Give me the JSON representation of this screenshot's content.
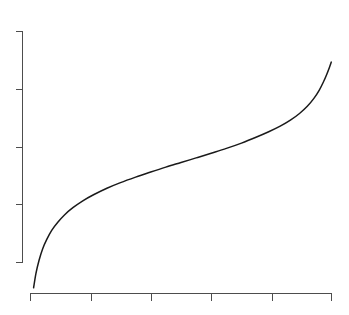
{
  "figure": {
    "title": "",
    "background_color": "#ffffff",
    "width": 349,
    "height": 315
  },
  "axes": {
    "line_color": "#4d4d4d",
    "x_axis": {
      "label": "",
      "tick_labels": [
        "",
        "",
        "",
        "",
        "",
        ""
      ],
      "tick_count": 6,
      "pixel_start": 30,
      "pixel_end": 332,
      "pixel_y": 293
    },
    "y_axis": {
      "label": "",
      "tick_labels": [
        "",
        "",
        "",
        "",
        ""
      ],
      "tick_count": 5,
      "pixel_top": 31,
      "pixel_bottom": 262,
      "pixel_x": 22
    }
  },
  "curve": {
    "color": "#1a1a1a",
    "stroke_width": 1.5,
    "shape": "sigmoid-quantile",
    "legend_label": ""
  },
  "chart_data": {
    "type": "line",
    "title": "",
    "subtitle": "",
    "xlabel": "",
    "ylabel": "",
    "grid": false,
    "legend": null,
    "legend_position": "none",
    "xlim": [
      0,
      1
    ],
    "ylim": [
      0,
      1
    ],
    "x_tick_labels": [
      "",
      "",
      "",
      "",
      "",
      ""
    ],
    "y_tick_labels": [
      "",
      "",
      "",
      "",
      ""
    ],
    "series": [
      {
        "name": "quantile-curve",
        "color": "#1a1a1a",
        "x": [
          0.012,
          0.02,
          0.03,
          0.042,
          0.056,
          0.072,
          0.092,
          0.115,
          0.142,
          0.175,
          0.212,
          0.255,
          0.3,
          0.35,
          0.4,
          0.45,
          0.5,
          0.55,
          0.6,
          0.65,
          0.7,
          0.748,
          0.79,
          0.828,
          0.862,
          0.892,
          0.918,
          0.94,
          0.958,
          0.972,
          0.983,
          0.992,
          0.998
        ],
        "y": [
          0.022,
          0.085,
          0.14,
          0.19,
          0.232,
          0.27,
          0.305,
          0.338,
          0.368,
          0.398,
          0.425,
          0.452,
          0.476,
          0.5,
          0.522,
          0.543,
          0.563,
          0.583,
          0.603,
          0.624,
          0.647,
          0.672,
          0.696,
          0.72,
          0.746,
          0.775,
          0.806,
          0.84,
          0.876,
          0.912,
          0.945,
          0.975,
          0.997
        ]
      }
    ],
    "pixel_points": [
      [
        33.6,
        287.8
      ],
      [
        36.0,
        273.2
      ],
      [
        39.0,
        260.5
      ],
      [
        42.6,
        248.9
      ],
      [
        46.9,
        239.2
      ],
      [
        51.7,
        230.4
      ],
      [
        57.8,
        222.3
      ],
      [
        64.7,
        214.7
      ],
      [
        72.9,
        207.7
      ],
      [
        82.8,
        200.8
      ],
      [
        94.0,
        194.5
      ],
      [
        106.9,
        188.2
      ],
      [
        120.5,
        182.6
      ],
      [
        135.6,
        177.1
      ],
      [
        150.7,
        172.0
      ],
      [
        165.8,
        167.1
      ],
      [
        181.0,
        162.5
      ],
      [
        196.1,
        157.9
      ],
      [
        211.2,
        153.2
      ],
      [
        226.4,
        148.4
      ],
      [
        241.5,
        143.1
      ],
      [
        256.0,
        137.3
      ],
      [
        268.7,
        131.8
      ],
      [
        280.2,
        126.2
      ],
      [
        290.4,
        120.2
      ],
      [
        299.5,
        113.5
      ],
      [
        307.3,
        106.3
      ],
      [
        313.9,
        98.4
      ],
      [
        319.3,
        90.1
      ],
      [
        323.5,
        81.8
      ],
      [
        326.8,
        74.2
      ],
      [
        329.5,
        67.2
      ],
      [
        331.3,
        62.1
      ]
    ]
  }
}
